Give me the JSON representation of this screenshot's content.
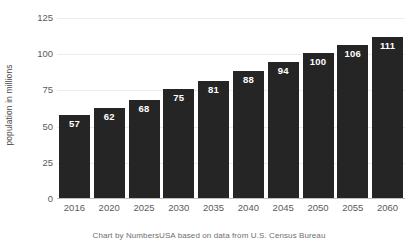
{
  "chart_data": {
    "type": "bar",
    "title": "",
    "subtitle": "",
    "xlabel": "",
    "ylabel": "population in millions",
    "categories": [
      "2016",
      "2020",
      "2025",
      "2030",
      "2035",
      "2040",
      "2045",
      "2050",
      "2055",
      "2060"
    ],
    "values": [
      57,
      62,
      68,
      75,
      81,
      88,
      94,
      100,
      106,
      111
    ],
    "value_labels": [
      "57",
      "62",
      "68",
      "75",
      "81",
      "88",
      "94",
      "100",
      "106",
      "111"
    ],
    "ylim": [
      0,
      125
    ],
    "yticks": [
      0,
      25,
      50,
      75,
      100,
      125
    ],
    "ytick_labels": [
      "0",
      "25",
      "50",
      "75",
      "100",
      "125"
    ],
    "grid": true,
    "grid_axis": "y",
    "legend": false,
    "legend_position": "none",
    "bar_color": "#252525",
    "value_label_color": "#ffffff",
    "gridline_color": "#ededf0",
    "axis_color": "#bfbfbf",
    "tick_label_color": "#5b5b5b",
    "background_color": "#ffffff",
    "caption": "Chart by NumbersUSA based on data from U.S. Census Bureau"
  }
}
